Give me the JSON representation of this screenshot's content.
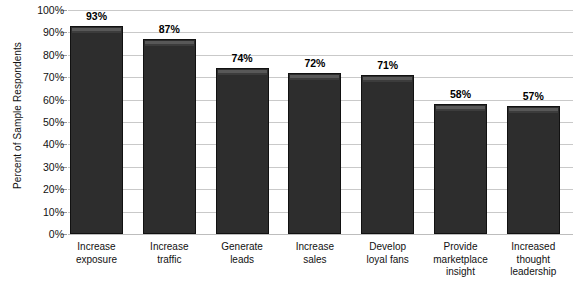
{
  "chart_data": {
    "type": "bar",
    "title": "",
    "xlabel": "",
    "ylabel": "Percent of Sample Respondents",
    "ylim": [
      0,
      100
    ],
    "grid": true,
    "legend": "none",
    "orientation": "vertical",
    "bar_color": "#2d2d2d",
    "gridline_color": "#c9c9c9",
    "categories": [
      "Increase exposure",
      "Increase traffic",
      "Generate leads",
      "Increase sales",
      "Develop loyal fans",
      "Provide marketplace insight",
      "Increased thought leadership"
    ],
    "category_lines": [
      [
        "Increase",
        "exposure"
      ],
      [
        "Increase",
        "traffic"
      ],
      [
        "Generate",
        "leads"
      ],
      [
        "Increase",
        "sales"
      ],
      [
        "Develop",
        "loyal fans"
      ],
      [
        "Provide",
        "marketplace",
        "insight"
      ],
      [
        "Increased",
        "thought",
        "leadership"
      ]
    ],
    "values": [
      93,
      87,
      74,
      72,
      71,
      58,
      57
    ],
    "value_labels": [
      "93%",
      "87%",
      "74%",
      "72%",
      "71%",
      "58%",
      "57%"
    ],
    "ytick_values": [
      0,
      10,
      20,
      30,
      40,
      50,
      60,
      70,
      80,
      90,
      100
    ],
    "ytick_labels": [
      "0%",
      "10%",
      "20%",
      "30%",
      "40%",
      "50%",
      "60%",
      "70%",
      "80%",
      "90%",
      "100%"
    ]
  }
}
